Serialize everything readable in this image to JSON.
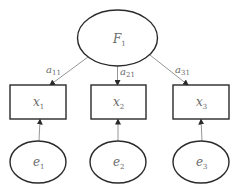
{
  "diagram": {
    "type": "confirmatory factor analysis path diagram",
    "latent_factor": {
      "id": "F1",
      "base": "F",
      "sub": "1"
    },
    "observed": [
      {
        "id": "x1",
        "base": "x",
        "sub": "1"
      },
      {
        "id": "x2",
        "base": "x",
        "sub": "2"
      },
      {
        "id": "x3",
        "base": "x",
        "sub": "3"
      }
    ],
    "errors": [
      {
        "id": "e1",
        "base": "e",
        "sub": "1"
      },
      {
        "id": "e2",
        "base": "e",
        "sub": "2"
      },
      {
        "id": "e3",
        "base": "e",
        "sub": "3"
      }
    ],
    "loadings": [
      {
        "from": "F1",
        "to": "x1",
        "base": "a",
        "sub": "11"
      },
      {
        "from": "F1",
        "to": "x2",
        "base": "a",
        "sub": "21"
      },
      {
        "from": "F1",
        "to": "x3",
        "base": "a",
        "sub": "31"
      }
    ],
    "error_paths": [
      {
        "from": "e1",
        "to": "x1"
      },
      {
        "from": "e2",
        "to": "x2"
      },
      {
        "from": "e3",
        "to": "x3"
      }
    ]
  }
}
